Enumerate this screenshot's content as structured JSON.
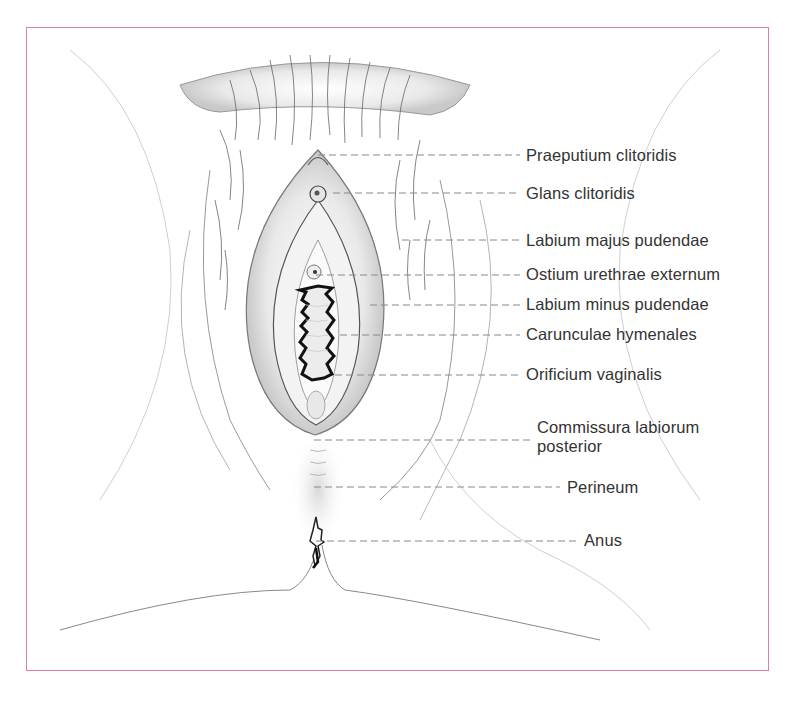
{
  "figure": {
    "frame_color": "#e0809e",
    "labels": [
      {
        "text": "Praeputium clitoridis",
        "x": 526,
        "y": 146,
        "line_y": 155,
        "line_x1": 318,
        "line_x2": 520
      },
      {
        "text": "Glans clitoridis",
        "x": 526,
        "y": 184,
        "line_y": 193,
        "line_x1": 333,
        "line_x2": 520
      },
      {
        "text": "Labium majus pudendae",
        "x": 526,
        "y": 231,
        "line_y": 240,
        "line_x1": 402,
        "line_x2": 520
      },
      {
        "text": "Ostium urethrae externum",
        "x": 526,
        "y": 265,
        "line_y": 275,
        "line_x1": 316,
        "line_x2": 520
      },
      {
        "text": "Labium minus pudendae",
        "x": 526,
        "y": 295,
        "line_y": 305,
        "line_x1": 370,
        "line_x2": 520
      },
      {
        "text": "Carunculae hymenales",
        "x": 526,
        "y": 325,
        "line_y": 335,
        "line_x1": 340,
        "line_x2": 520
      },
      {
        "text": "Orificium vaginalis",
        "x": 526,
        "y": 365,
        "line_y": 375,
        "line_x1": 335,
        "line_x2": 520
      },
      {
        "text": "Commissura labiorum",
        "text2": "posterior",
        "x": 537,
        "y": 418,
        "line_y": 440,
        "line_x1": 314,
        "line_x2": 530
      },
      {
        "text": "Perineum",
        "x": 567,
        "y": 478,
        "line_y": 487,
        "line_x1": 314,
        "line_x2": 560
      },
      {
        "text": "Anus",
        "x": 584,
        "y": 531,
        "line_y": 541,
        "line_x1": 316,
        "line_x2": 578
      }
    ]
  }
}
